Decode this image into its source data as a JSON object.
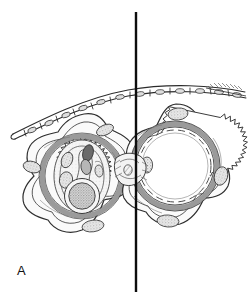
{
  "figure": {
    "panel_label": "A",
    "background_color": "#ffffff",
    "ink_color": "#1a1a1a",
    "divider": {
      "name": "vertical-midline",
      "x": 136,
      "y_top": 12,
      "y_bottom": 292,
      "stroke_width": 2.4,
      "color": "#0d0d0d"
    },
    "palette": {
      "outline": "#2b2b2b",
      "thin_line": "#4a4a4a",
      "integument_gray": "#9a9a9a",
      "wall_band_gray": "#8d8d8d",
      "cell_fill": "#e8e8e8",
      "nucleus_fill": "#c9c9c9",
      "stipple_fill": "#d6d6d6",
      "light_fill": "#f2f2f2",
      "hollow_fill": "#ffffff"
    }
  },
  "structures": {
    "epithelium": {
      "name": "epithelial-cell-layer",
      "description": "curved double-walled epithelial sheet arcing across the top of the figure",
      "cell_count": 12,
      "left_end": {
        "x": 13,
        "y": 134
      },
      "right_end": {
        "x": 245,
        "y": 92
      },
      "apex": {
        "x": 140,
        "y": 88
      }
    },
    "left_ovule": {
      "name": "left-ovule-half",
      "description": "ovule half shown with embryo sac contents, stippled egg apparatus and surrounding integument",
      "center": {
        "x": 82,
        "y": 176
      },
      "outer_radius": 62,
      "serrated_ring_radius": 44,
      "serration_teeth": 34,
      "gray_band_width": 4.5,
      "contents": [
        {
          "name": "large-stippled-nucleus",
          "cx": 82,
          "cy": 196,
          "rx": 18,
          "ry": 18
        },
        {
          "name": "upper-dark-body",
          "cx": 88,
          "cy": 152,
          "rx": 6,
          "ry": 10
        },
        {
          "name": "mid-oval-body",
          "cx": 86,
          "cy": 166,
          "rx": 6,
          "ry": 9
        },
        {
          "name": "left-small-cell",
          "cx": 66,
          "cy": 160,
          "rx": 6,
          "ry": 9
        },
        {
          "name": "lower-left-cell",
          "cx": 64,
          "cy": 180,
          "rx": 8,
          "ry": 9
        },
        {
          "name": "embryo-sac-outline",
          "cx": 82,
          "cy": 176,
          "rx": 28,
          "ry": 36
        }
      ],
      "lobe_cells": [
        {
          "name": "top-lobe-cell",
          "cx": 104,
          "cy": 130,
          "rx": 9,
          "ry": 5,
          "angle": -22
        },
        {
          "name": "left-lobe-cell",
          "cx": 32,
          "cy": 168,
          "rx": 9,
          "ry": 6,
          "angle": 18
        },
        {
          "name": "bottom-lobe-cell",
          "cx": 93,
          "cy": 226,
          "rx": 11,
          "ry": 6,
          "angle": -8
        }
      ]
    },
    "right_ovule": {
      "name": "right-ovule-half",
      "description": "matching ovule half drawn hollow, showing only the serrated wall ring and integument lobes",
      "center": {
        "x": 175,
        "y": 166
      },
      "outer_radius": 60,
      "serrated_ring_radius": 46,
      "serration_teeth": 36,
      "gray_band_width": 4.5,
      "lumen_fill": "#ffffff",
      "lobe_cells": [
        {
          "name": "top-lobe-cell",
          "cx": 177,
          "cy": 114,
          "rx": 10,
          "ry": 6,
          "angle": -6
        },
        {
          "name": "right-lobe-cell",
          "cx": 222,
          "cy": 176,
          "rx": 7,
          "ry": 10,
          "angle": 14
        },
        {
          "name": "bottom-lobe-cell",
          "cx": 168,
          "cy": 221,
          "rx": 11,
          "ry": 6,
          "angle": 4
        },
        {
          "name": "left-inner-cell",
          "cx": 147,
          "cy": 165,
          "rx": 6,
          "ry": 8,
          "angle": 0
        }
      ]
    },
    "funiculus": {
      "name": "funiculus-attachment",
      "description": "hatched attachment region between the two ovule halves at the midline",
      "x": 130,
      "y": 170
    },
    "cut_end_hatching": {
      "name": "membrane-cut-end-hatching",
      "x": 215,
      "y": 86
    }
  }
}
